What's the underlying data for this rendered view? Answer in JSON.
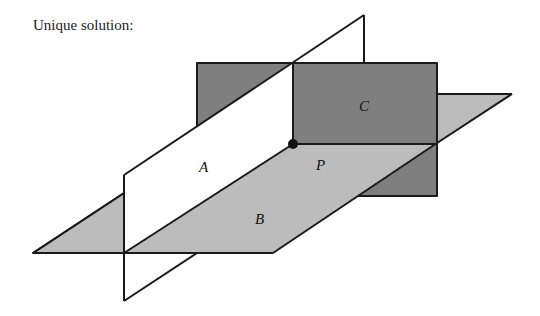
{
  "title": "Unique solution:",
  "planes": {
    "A": {
      "label": "A",
      "color": "#ffffff"
    },
    "B": {
      "label": "B",
      "color": "#bcbcbc"
    },
    "C": {
      "label": "C",
      "color": "#7f7f7f"
    }
  },
  "point": {
    "label": "P"
  },
  "colors": {
    "stroke": "#1a1a1a",
    "dark_plane": "#7f7f7f",
    "light_plane": "#bcbcbc"
  }
}
